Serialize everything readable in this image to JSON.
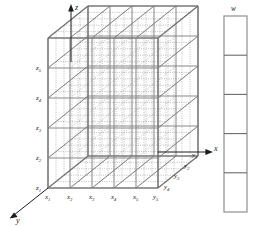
{
  "figure": {
    "title": "",
    "type": "3d-lattice-grid-diagram",
    "axes": {
      "z": {
        "label": "z",
        "direction": "up",
        "ticks": [
          "z",
          "z",
          "z",
          "z",
          "z"
        ],
        "tick_subscripts": [
          "1",
          "2",
          "3",
          "4",
          "5"
        ],
        "tick_labels": [
          "z1",
          "z2",
          "z3",
          "z4",
          "z5"
        ]
      },
      "x": {
        "label": "x",
        "direction": "right",
        "ticks": [
          "x",
          "x",
          "x",
          "x",
          "x"
        ],
        "tick_subscripts": [
          "1",
          "2",
          "3",
          "4",
          "5"
        ],
        "tick_labels": [
          "x1",
          "x2",
          "x3",
          "x4",
          "x5"
        ]
      },
      "y": {
        "label": "y",
        "direction": "down-left",
        "ticks": [
          "y",
          "y",
          "y",
          "y",
          "y"
        ],
        "tick_subscripts": [
          "1",
          "2",
          "3",
          "4",
          "5"
        ],
        "tick_labels": [
          "y1",
          "y2",
          "y3",
          "y4",
          "y5"
        ]
      }
    },
    "grid": {
      "divisions_x": 5,
      "divisions_y": 5,
      "divisions_z": 5,
      "outer_line_style": "solid",
      "inner_line_style": "dotted",
      "outer_color": "#8a8a8a",
      "inner_color": "#9a9a9a"
    },
    "panel": {
      "label": "w",
      "cells": 5,
      "border_color": "#8f8f8f",
      "divider_color": "#6a6a6a"
    }
  }
}
